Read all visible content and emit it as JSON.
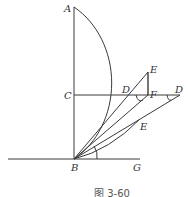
{
  "figure": {
    "caption": "图 3-60",
    "points": {
      "A": "A",
      "C": "C",
      "B": "B",
      "G": "G",
      "D_inner": "D",
      "D_outer": "D",
      "E_upper": "E",
      "E_lower": "E",
      "F": "F"
    }
  }
}
